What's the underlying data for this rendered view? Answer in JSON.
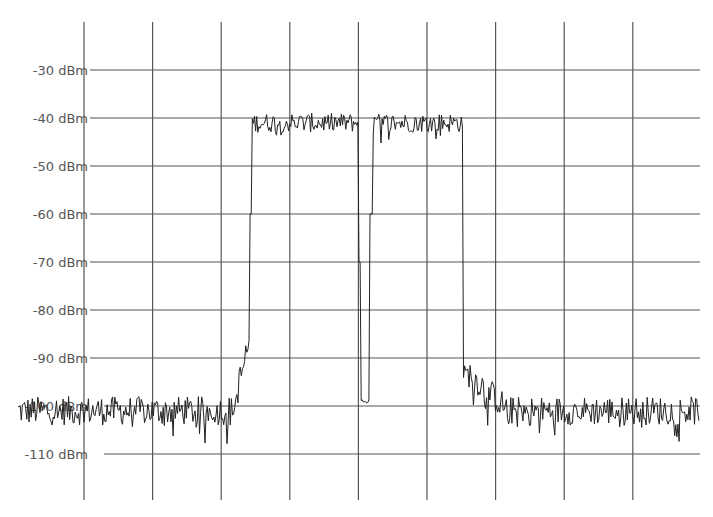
{
  "chart_data": {
    "type": "line",
    "title": "",
    "xlabel": "",
    "ylabel": "Power (dBm)",
    "y_ticks": [
      {
        "label": "-30 dBm",
        "value": -30
      },
      {
        "label": "-40 dBm",
        "value": -40
      },
      {
        "label": "-50 dBm",
        "value": -50
      },
      {
        "label": "-60 dBm",
        "value": -60
      },
      {
        "label": "-70 dBm",
        "value": -70
      },
      {
        "label": "-80 dBm",
        "value": -80
      },
      {
        "label": "-90 dBm",
        "value": -90
      },
      {
        "label": "-100 dBm",
        "value": -100
      },
      {
        "label": "-110 dBm",
        "value": -110
      }
    ],
    "ylim": [
      -116,
      -22
    ],
    "x_gridlines": 9,
    "grid": true,
    "legend": "none",
    "series": [
      {
        "name": "Spectrum trace",
        "description": "Noise floor ~-101 dBm, wideband signal plateau ~-41 dBm spanning roughly grid divisions 2.4 to 5.5, with a narrow notch near center dropping to ~-99 dBm",
        "segments": [
          {
            "x_frac": [
              0.0,
              0.32
            ],
            "level_dBm": -101,
            "noise_dB": 3
          },
          {
            "x_frac": [
              0.32,
              0.34
            ],
            "level_dBm": -92,
            "noise_dB": 4,
            "note": "rising skirt"
          },
          {
            "x_frac": [
              0.34,
              0.5
            ],
            "level_dBm": -41,
            "noise_dB": 2
          },
          {
            "x_frac": [
              0.505,
              0.515
            ],
            "level_dBm": -99,
            "note": "center notch"
          },
          {
            "x_frac": [
              0.52,
              0.655
            ],
            "level_dBm": -41,
            "noise_dB": 2
          },
          {
            "x_frac": [
              0.655,
              0.7
            ],
            "level_dBm": -96,
            "noise_dB": 3,
            "note": "falling skirt"
          },
          {
            "x_frac": [
              0.7,
              1.0
            ],
            "level_dBm": -101,
            "noise_dB": 3
          }
        ]
      }
    ]
  },
  "colors": {
    "background": "#ffffff",
    "grid": "#555555",
    "trace": "#222222",
    "label": "#555555"
  }
}
